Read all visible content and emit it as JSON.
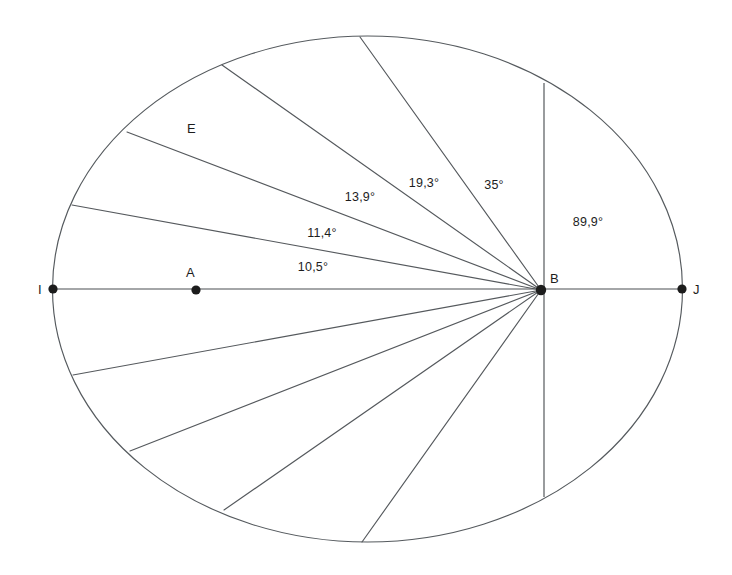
{
  "figure": {
    "background_color": "#ffffff",
    "stroke_color": "#55595d",
    "text_color": "#1d1d1d",
    "width": 732,
    "height": 575
  },
  "chart_data": {
    "type": "diagram",
    "subtype": "angular-sector-ellipse",
    "title": "",
    "xlabel": "",
    "ylabel": "",
    "ellipse": {
      "center_x": 367.5,
      "center_y": 289,
      "rx": 315,
      "ry": 253,
      "stroke": "#55595d"
    },
    "points": [
      {
        "id": "I",
        "label": "I",
        "x": 53,
        "y": 289,
        "label_x": 38,
        "label_y": 294,
        "dot": true,
        "dot_r": 4.6
      },
      {
        "id": "A",
        "label": "A",
        "x": 196,
        "y": 290,
        "label_x": 186,
        "label_y": 277,
        "dot": true,
        "dot_r": 4.6
      },
      {
        "id": "B",
        "label": "B",
        "x": 541,
        "y": 290,
        "label_x": 550,
        "label_y": 283,
        "dot": true,
        "dot_r": 5.2
      },
      {
        "id": "J",
        "label": "J",
        "x": 682,
        "y": 289,
        "label_x": 693,
        "label_y": 294,
        "dot": true,
        "dot_r": 4.6
      },
      {
        "id": "E",
        "label": "E",
        "x": 193,
        "y": 128,
        "label_x": 187,
        "label_y": 133,
        "dot": false,
        "dot_r": 0
      }
    ],
    "horizontal_axis": {
      "x1": 53,
      "y1": 289,
      "x2": 682,
      "y2": 289
    },
    "vertical_chord": {
      "x1": 544,
      "y1": 83,
      "x2": 544,
      "y2": 497
    },
    "rays": [
      {
        "id": "ray-up-1",
        "x1": 541,
        "y1": 290,
        "x2": 72,
        "y2": 205
      },
      {
        "id": "ray-up-2",
        "x1": 541,
        "y1": 290,
        "x2": 127,
        "y2": 132
      },
      {
        "id": "ray-up-3",
        "x1": 541,
        "y1": 290,
        "x2": 222,
        "y2": 65
      },
      {
        "id": "ray-up-4",
        "x1": 541,
        "y1": 290,
        "x2": 360,
        "y2": 37
      },
      {
        "id": "ray-down-1",
        "x1": 541,
        "y1": 290,
        "x2": 73,
        "y2": 375
      },
      {
        "id": "ray-down-2",
        "x1": 541,
        "y1": 290,
        "x2": 130,
        "y2": 451
      },
      {
        "id": "ray-down-3",
        "x1": 541,
        "y1": 290,
        "x2": 224,
        "y2": 510
      },
      {
        "id": "ray-down-4",
        "x1": 541,
        "y1": 290,
        "x2": 362,
        "y2": 542
      }
    ],
    "angle_labels": [
      {
        "id": "angle-10-5",
        "value": 10.5,
        "text": "10,5°",
        "x": 313,
        "y": 271
      },
      {
        "id": "angle-11-4",
        "value": 11.4,
        "text": "11,4°",
        "x": 322,
        "y": 237
      },
      {
        "id": "angle-13-9",
        "value": 13.9,
        "text": "13,9°",
        "x": 360,
        "y": 201
      },
      {
        "id": "angle-19-3",
        "value": 19.3,
        "text": "19,3°",
        "x": 424,
        "y": 187
      },
      {
        "id": "angle-35",
        "value": 35.0,
        "text": "35°",
        "x": 494,
        "y": 189
      },
      {
        "id": "angle-89-9",
        "value": 89.9,
        "text": "89,9°",
        "x": 588,
        "y": 226
      }
    ],
    "angle_values": [
      10.5,
      11.4,
      13.9,
      19.3,
      35.0,
      89.9
    ],
    "angle_texts": [
      "10,5°",
      "11,4°",
      "13,9°",
      "19,3°",
      "35°",
      "89,9°"
    ],
    "point_labels": [
      "I",
      "A",
      "B",
      "J",
      "E"
    ],
    "legend": [],
    "grid": false
  }
}
